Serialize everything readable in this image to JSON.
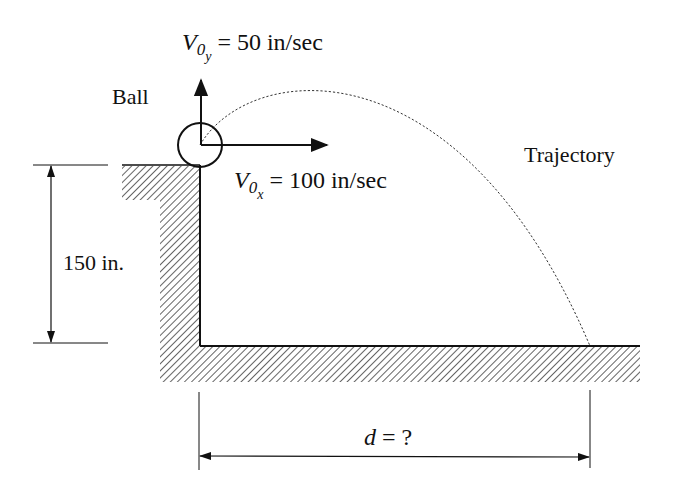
{
  "diagram": {
    "labels": {
      "ball": "Ball",
      "trajectory": "Trajectory",
      "height": "150 in.",
      "distance": "d = ?",
      "distance_var": "d",
      "distance_rest": " = ?"
    },
    "velocity_y": {
      "symbol": "V",
      "subscript": "0",
      "subsubscript": "y",
      "value_text": " = 50 in/sec",
      "value": 50,
      "unit": "in/sec"
    },
    "velocity_x": {
      "symbol": "V",
      "subscript": "0",
      "subsubscript": "x",
      "value_text": " = 100 in/sec",
      "value": 100,
      "unit": "in/sec"
    },
    "height": {
      "value": 150,
      "unit": "in."
    },
    "colors": {
      "ink": "#111111",
      "background": "#ffffff"
    }
  }
}
